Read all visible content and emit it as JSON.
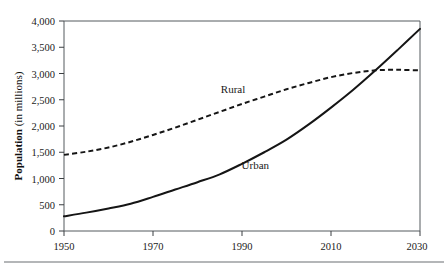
{
  "chart_data": {
    "type": "line",
    "title": "",
    "xlabel": "",
    "ylabel": "Population (in millions)",
    "ylabel_bold_part": "Population",
    "ylabel_normal_part": " (in millions)",
    "xlim": [
      1950,
      2030
    ],
    "ylim": [
      0,
      4000
    ],
    "x_ticks": [
      1950,
      1970,
      1990,
      2010,
      2030
    ],
    "x_tick_labels": [
      "1950",
      "1970",
      "1990",
      "2010",
      "2030"
    ],
    "y_ticks": [
      0,
      500,
      1000,
      1500,
      2000,
      2500,
      3000,
      3500,
      4000
    ],
    "y_tick_labels": [
      "0",
      "500",
      "1,000",
      "1,500",
      "2,000",
      "2,500",
      "3,000",
      "3,500",
      "4,000"
    ],
    "grid": false,
    "legend_position": "inline-annotations",
    "series": [
      {
        "name": "Rural",
        "style": "dashed",
        "color": "#151515",
        "label_x": 1988,
        "label_y": 2620,
        "x": [
          1950,
          1955,
          1960,
          1965,
          1970,
          1975,
          1980,
          1985,
          1990,
          1995,
          2000,
          2005,
          2010,
          2015,
          2020,
          2025,
          2030
        ],
        "values": [
          1450,
          1510,
          1590,
          1700,
          1830,
          1970,
          2120,
          2270,
          2420,
          2560,
          2700,
          2820,
          2930,
          3010,
          3060,
          3070,
          3060
        ]
      },
      {
        "name": "Urban",
        "style": "solid",
        "color": "#151515",
        "label_x": 1993,
        "label_y": 1180,
        "x": [
          1950,
          1955,
          1960,
          1965,
          1970,
          1975,
          1980,
          1985,
          1990,
          1995,
          2000,
          2005,
          2010,
          2015,
          2020,
          2025,
          2030
        ],
        "values": [
          280,
          350,
          430,
          520,
          650,
          790,
          930,
          1080,
          1280,
          1500,
          1740,
          2030,
          2350,
          2690,
          3060,
          3450,
          3850
        ]
      }
    ],
    "annotations": [
      {
        "text": "Rural",
        "x": 1988,
        "y": 2620
      },
      {
        "text": "Urban",
        "x": 1993,
        "y": 1180
      }
    ],
    "crossover": {
      "year": 2019,
      "value": 3050
    }
  },
  "figure": {
    "footer_rule": true
  }
}
